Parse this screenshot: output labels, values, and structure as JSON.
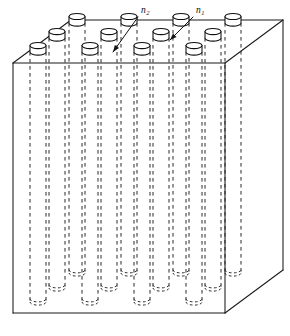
{
  "figure": {
    "kind": "technical-line-drawing",
    "background_color": "#ffffff",
    "line_color": "#1a1a1a",
    "hidden_line_color": "#2b2b2b"
  },
  "labels": [
    {
      "id": "n2",
      "base": "n",
      "subscript": "2",
      "text": "n₂",
      "meaning": "refractive index of surrounding matrix block",
      "x": 141,
      "y": 13,
      "leader": {
        "x1": 138,
        "y1": 17,
        "x2": 113,
        "y2": 52
      },
      "arrow_at": {
        "x": 113,
        "y": 52
      }
    },
    {
      "id": "n1",
      "base": "n",
      "subscript": "1",
      "text": "n₁",
      "meaning": "refractive index of cylindrical rod / hole",
      "x": 196,
      "y": 13,
      "leader": {
        "x1": 193,
        "y1": 17,
        "x2": 170,
        "y2": 40
      },
      "arrow_at": {
        "x": 170,
        "y": 40
      }
    }
  ],
  "box": {
    "projection": "oblique-cabinet",
    "front_face": {
      "left": 13,
      "right": 225,
      "top": 63,
      "bottom": 313
    },
    "depth_offset": {
      "dx": 58,
      "dy": -43
    },
    "vertices": {
      "front_top_left": [
        13,
        63
      ],
      "front_top_right": [
        225,
        63
      ],
      "front_bottom_left": [
        13,
        313
      ],
      "front_bottom_right": [
        225,
        313
      ],
      "back_top_left": [
        71,
        20
      ],
      "back_top_right": [
        283,
        20
      ],
      "back_bottom_left": [
        71,
        270
      ],
      "back_bottom_right": [
        283,
        270
      ]
    },
    "hidden_edges": [
      "back_bottom_left-to-front_bottom_left",
      "back_bottom_left-to-back_bottom_right"
    ]
  },
  "holes": {
    "description": "array of cylindrical inclusions normal to the top face, drawn as protruding cylinder tops on the top face and dashed walls through the body",
    "columns": 4,
    "rows": 3,
    "total_visible_tops": 12,
    "top_ellipse": {
      "rx": 8.0,
      "ry": 3.1
    },
    "cylinder_rise": 6.5,
    "grid_origin": [
      38,
      52
    ],
    "col_step": {
      "dx": 52,
      "dy": 0
    },
    "row_step": {
      "dx": 19.3,
      "dy": -14.3
    },
    "depth_to_bottom": 250
  },
  "chart_data": {
    "type": "table",
    "columns": [
      "row",
      "col",
      "cx",
      "cy"
    ],
    "rows": [
      [
        0,
        0,
        38,
        52
      ],
      [
        0,
        1,
        90,
        52
      ],
      [
        0,
        2,
        142,
        52
      ],
      [
        0,
        3,
        194,
        52
      ],
      [
        1,
        0,
        57,
        38
      ],
      [
        1,
        1,
        109,
        38
      ],
      [
        1,
        2,
        161,
        38
      ],
      [
        1,
        3,
        213,
        38
      ],
      [
        2,
        0,
        77,
        23
      ],
      [
        2,
        1,
        129,
        23
      ],
      [
        2,
        2,
        181,
        23
      ],
      [
        2,
        3,
        233,
        23
      ]
    ]
  }
}
